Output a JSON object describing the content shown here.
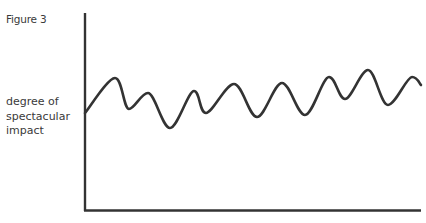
{
  "figure": {
    "label": "Figure 3",
    "y_axis_label_lines": [
      "degree of",
      "spectacular",
      "impact"
    ]
  },
  "chart_data": {
    "type": "line",
    "title": "Figure 3",
    "xlabel": "",
    "ylabel": "degree of spectacular impact",
    "grid": false,
    "legend": null,
    "ticks": {
      "x": [],
      "y": []
    },
    "series": [
      {
        "name": "spectacular impact",
        "points_px": [
          [
            85,
            113
          ],
          [
            115,
            78
          ],
          [
            129,
            109
          ],
          [
            148,
            93
          ],
          [
            170,
            128
          ],
          [
            194,
            91
          ],
          [
            206,
            113
          ],
          [
            234,
            84
          ],
          [
            257,
            117
          ],
          [
            282,
            83
          ],
          [
            305,
            115
          ],
          [
            329,
            77
          ],
          [
            345,
            99
          ],
          [
            368,
            70
          ],
          [
            388,
            105
          ],
          [
            412,
            77
          ],
          [
            421,
            85
          ]
        ]
      }
    ],
    "colors": {
      "line": "#333333",
      "axis": "#333333",
      "text": "#3a3a3a"
    }
  }
}
